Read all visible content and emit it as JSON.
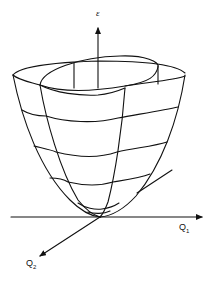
{
  "diagram": {
    "type": "3d-surface-plot",
    "axes": {
      "vertical": {
        "label": "ε"
      },
      "x": {
        "label": "Q",
        "subscript": "1"
      },
      "y": {
        "label": "Q",
        "subscript": "2"
      }
    },
    "colors": {
      "line": "#111111",
      "background": "#ffffff"
    }
  }
}
